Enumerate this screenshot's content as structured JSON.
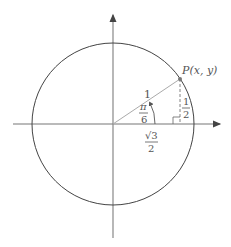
{
  "diagram": {
    "point_label": "P(x, y)",
    "radius_label": "1",
    "angle_label": {
      "numerator": "π",
      "denominator": "6"
    },
    "x_label": {
      "numerator": "√3",
      "denominator": "2"
    },
    "y_label": {
      "numerator": "1",
      "denominator": "2"
    },
    "colors": {
      "axis": "#777777",
      "circle": "#444444",
      "radius_line": "#999999",
      "point": "#777777",
      "text": "#555555"
    }
  }
}
